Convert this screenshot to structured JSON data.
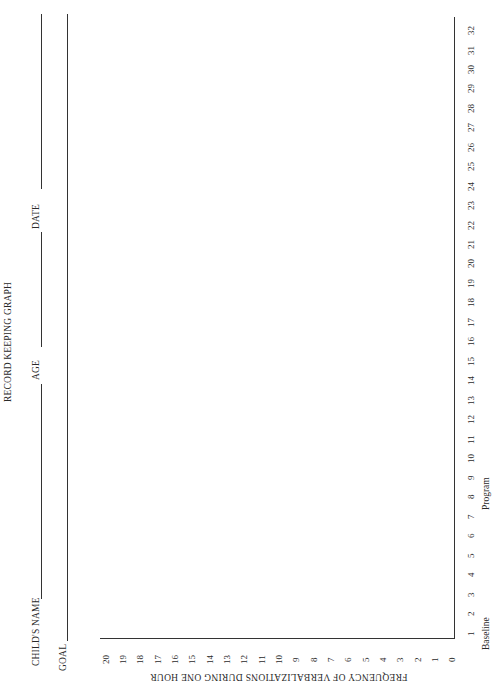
{
  "form": {
    "title": "RECORD KEEPING GRAPH",
    "fields": {
      "childs_name_label": "CHILD'S NAME",
      "age_label": "AGE",
      "date_label": "DATE",
      "goal_label": "GOAL"
    }
  },
  "chart_data": {
    "type": "line",
    "title": "RECORD KEEPING GRAPH",
    "xlabel": "Sessions (Baseline / Program)",
    "ylabel": "FREQUENCY OF VERBALIZATIONS DURING ONE HOUR",
    "x_phase_labels": [
      "Baseline",
      "Program"
    ],
    "x": [
      1,
      2,
      3,
      4,
      5,
      6,
      7,
      8,
      9,
      10,
      11,
      12,
      13,
      14,
      15,
      16,
      17,
      18,
      19,
      20,
      21,
      22,
      23,
      24,
      25,
      26,
      27,
      28,
      29,
      30,
      31,
      32
    ],
    "y_ticks": [
      0,
      1,
      2,
      3,
      4,
      5,
      6,
      7,
      8,
      9,
      10,
      11,
      12,
      13,
      14,
      15,
      16,
      17,
      18,
      19,
      20
    ],
    "ylim": [
      0,
      20
    ],
    "xlim": [
      1,
      32
    ],
    "series": [],
    "grid": false,
    "orientation": "rotated 90 degrees counterclockwise on page"
  },
  "axes": {
    "y_label": "FREQUENCY OF VERBALIZATIONS DURING ONE HOUR",
    "y_ticks": [
      "20",
      "19",
      "18",
      "17",
      "16",
      "15",
      "14",
      "13",
      "12",
      "11",
      "10",
      "9",
      "8",
      "7",
      "6",
      "5",
      "4",
      "3",
      "2",
      "1",
      "0"
    ],
    "x_ticks": [
      "1",
      "2",
      "3",
      "4",
      "5",
      "6",
      "7",
      "8",
      "9",
      "10",
      "11",
      "12",
      "13",
      "14",
      "15",
      "16",
      "17",
      "18",
      "19",
      "20",
      "21",
      "22",
      "23",
      "24",
      "25",
      "26",
      "27",
      "28",
      "29",
      "30",
      "31",
      "32"
    ],
    "baseline_label": "Baseline",
    "program_label": "Program"
  }
}
